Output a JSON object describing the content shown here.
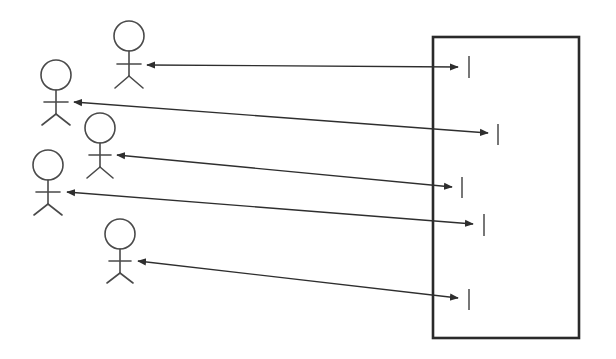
{
  "diagram": {
    "type": "actor-system interaction diagram",
    "canvas": {
      "width": 616,
      "height": 359,
      "background": "#ffffff"
    },
    "colors": {
      "actor_stroke": "#4a4a4a",
      "arrow_stroke": "#2e2e2e",
      "box_stroke": "#2a2a2a",
      "port_stroke": "#555555"
    },
    "system_box": {
      "x": 433,
      "y": 37,
      "width": 146,
      "height": 301,
      "label": ""
    },
    "actors": [
      {
        "id": "actor-1",
        "head_cx": 129,
        "head_cy": 36,
        "head_r": 15,
        "arms_y": 64,
        "arm_half": 12,
        "hip_y": 76,
        "foot_y": 88,
        "leg_spread": 14
      },
      {
        "id": "actor-2",
        "head_cx": 56,
        "head_cy": 75,
        "head_r": 15,
        "arms_y": 102,
        "arm_half": 12,
        "hip_y": 114,
        "foot_y": 125,
        "leg_spread": 14
      },
      {
        "id": "actor-3",
        "head_cx": 100,
        "head_cy": 128,
        "head_r": 15,
        "arms_y": 155,
        "arm_half": 11,
        "hip_y": 167,
        "foot_y": 178,
        "leg_spread": 13
      },
      {
        "id": "actor-4",
        "head_cx": 48,
        "head_cy": 165,
        "head_r": 15,
        "arms_y": 192,
        "arm_half": 12,
        "hip_y": 204,
        "foot_y": 215,
        "leg_spread": 14
      },
      {
        "id": "actor-5",
        "head_cx": 120,
        "head_cy": 234,
        "head_r": 15,
        "arms_y": 261,
        "arm_half": 11,
        "hip_y": 273,
        "foot_y": 283,
        "leg_spread": 13
      }
    ],
    "connections": [
      {
        "from": "actor-1",
        "to": "port-1",
        "x1": 147,
        "y1": 65,
        "x2": 458,
        "y2": 67,
        "bidirectional": true
      },
      {
        "from": "actor-2",
        "to": "port-2",
        "x1": 74,
        "y1": 102,
        "x2": 488,
        "y2": 133,
        "bidirectional": true
      },
      {
        "from": "actor-3",
        "to": "port-3",
        "x1": 117,
        "y1": 155,
        "x2": 452,
        "y2": 187,
        "bidirectional": true
      },
      {
        "from": "actor-4",
        "to": "port-4",
        "x1": 67,
        "y1": 192,
        "x2": 473,
        "y2": 224,
        "bidirectional": true
      },
      {
        "from": "actor-5",
        "to": "port-5",
        "x1": 138,
        "y1": 261,
        "x2": 458,
        "y2": 298,
        "bidirectional": true
      }
    ],
    "ports": [
      {
        "id": "port-1",
        "x": 469,
        "y1": 56,
        "y2": 78
      },
      {
        "id": "port-2",
        "x": 498,
        "y1": 124,
        "y2": 145
      },
      {
        "id": "port-3",
        "x": 462,
        "y1": 177,
        "y2": 198
      },
      {
        "id": "port-4",
        "x": 484,
        "y1": 214,
        "y2": 236
      },
      {
        "id": "port-5",
        "x": 469,
        "y1": 289,
        "y2": 310
      }
    ]
  }
}
